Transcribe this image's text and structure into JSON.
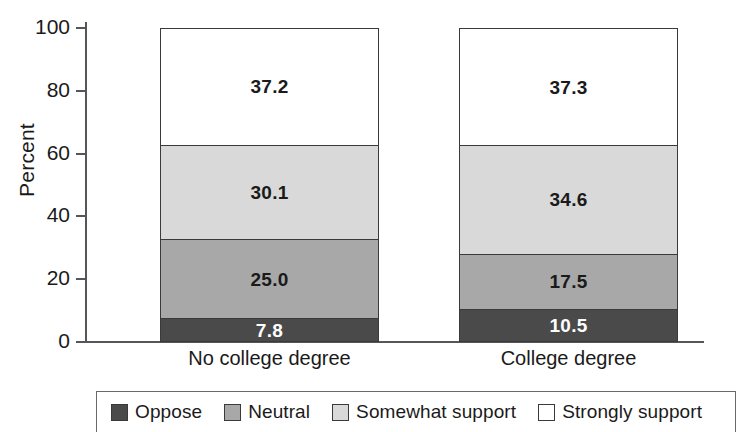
{
  "chart_data": {
    "type": "bar",
    "subtype": "stacked-bar-100",
    "title": "",
    "xlabel": "",
    "ylabel": "Percent",
    "ylim": [
      0,
      100
    ],
    "yticks": [
      0,
      20,
      40,
      60,
      80,
      100
    ],
    "ytick_labels": [
      "0",
      "20",
      "40",
      "60",
      "80",
      "100"
    ],
    "grid": false,
    "legend_position": "bottom",
    "categories": [
      "No college degree",
      "College degree"
    ],
    "series": [
      {
        "name": "Oppose",
        "values": [
          7.8,
          10.5
        ],
        "color": "#4a4a4a",
        "label_color": "#ffffff"
      },
      {
        "name": "Neutral",
        "values": [
          25.0,
          17.5
        ],
        "color": "#a8a8a8",
        "label_color": "#1a1a1a"
      },
      {
        "name": "Somewhat support",
        "values": [
          30.1,
          34.6
        ],
        "color": "#d9d9d9",
        "label_color": "#1a1a1a"
      },
      {
        "name": "Strongly support",
        "values": [
          37.2,
          37.3
        ],
        "color": "#ffffff",
        "label_color": "#1a1a1a"
      }
    ],
    "data_labels": {
      "No college degree": [
        "7.8",
        "25.0",
        "30.1",
        "37.2"
      ],
      "College degree": [
        "10.5",
        "17.5",
        "34.6",
        "37.3"
      ]
    }
  },
  "axis": {
    "y_title": "Percent",
    "y_ticks": [
      "100",
      "80",
      "60",
      "40",
      "20",
      "0"
    ]
  },
  "bars": [
    {
      "category": "No college degree",
      "segments": [
        {
          "series": "Strongly support",
          "value": 37.2,
          "label": "37.2"
        },
        {
          "series": "Somewhat support",
          "value": 30.1,
          "label": "30.1"
        },
        {
          "series": "Neutral",
          "value": 25.0,
          "label": "25.0"
        },
        {
          "series": "Oppose",
          "value": 7.8,
          "label": "7.8"
        }
      ]
    },
    {
      "category": "College degree",
      "segments": [
        {
          "series": "Strongly support",
          "value": 37.3,
          "label": "37.3"
        },
        {
          "series": "Somewhat support",
          "value": 34.6,
          "label": "34.6"
        },
        {
          "series": "Neutral",
          "value": 17.5,
          "label": "17.5"
        },
        {
          "series": "Oppose",
          "value": 10.5,
          "label": "10.5"
        }
      ]
    }
  ],
  "legend": {
    "items": [
      {
        "label": "Oppose",
        "color": "#4a4a4a"
      },
      {
        "label": "Neutral",
        "color": "#a8a8a8"
      },
      {
        "label": "Somewhat support",
        "color": "#d9d9d9"
      },
      {
        "label": "Strongly support",
        "color": "#ffffff"
      }
    ]
  },
  "colors": {
    "oppose": "#4a4a4a",
    "neutral": "#a8a8a8",
    "somewhat_support": "#d9d9d9",
    "strongly_support": "#ffffff",
    "axis": "#54565a",
    "outline": "#3a3a3a",
    "text": "#1a1a1a"
  }
}
